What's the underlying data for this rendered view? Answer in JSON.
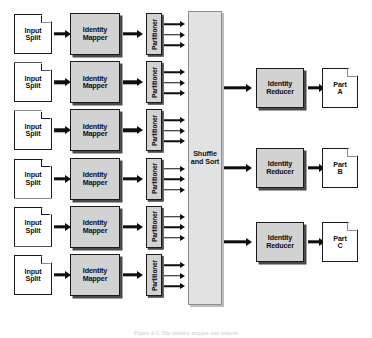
{
  "figure": {
    "caption": "Figure 4-3. The identity mapper and reducer",
    "background_color": "#fefefe",
    "box_fill_color": "#d2d2d2",
    "shuffle_fill_color": "#e2e2e2",
    "line_color": "#1a1a1a"
  },
  "labels": {
    "input_split": "Input\nSplit",
    "identity_mapper": "Identity\nMapper",
    "partitioner": "Partitioner",
    "shuffle_and_sort": "Shuffle\nand Sort",
    "identity_reducer": "Identity\nReducer"
  },
  "input_splits": [
    {
      "id": "input-split-1",
      "label_line1": "Input",
      "label_line2": "Split"
    },
    {
      "id": "input-split-2",
      "label_line1": "Input",
      "label_line2": "Split"
    },
    {
      "id": "input-split-3",
      "label_line1": "Input",
      "label_line2": "Split"
    },
    {
      "id": "input-split-4",
      "label_line1": "Input",
      "label_line2": "Split"
    },
    {
      "id": "input-split-5",
      "label_line1": "Input",
      "label_line2": "Split"
    },
    {
      "id": "input-split-6",
      "label_line1": "Input",
      "label_line2": "Split"
    }
  ],
  "mappers": [
    {
      "id": "identity-mapper-1",
      "label_line1": "Identity",
      "label_line2": "Mapper"
    },
    {
      "id": "identity-mapper-2",
      "label_line1": "Identity",
      "label_line2": "Mapper"
    },
    {
      "id": "identity-mapper-3",
      "label_line1": "Identity",
      "label_line2": "Mapper"
    },
    {
      "id": "identity-mapper-4",
      "label_line1": "Identity",
      "label_line2": "Mapper"
    },
    {
      "id": "identity-mapper-5",
      "label_line1": "Identity",
      "label_line2": "Mapper"
    },
    {
      "id": "identity-mapper-6",
      "label_line1": "Identity",
      "label_line2": "Mapper"
    }
  ],
  "partitioners": [
    {
      "id": "partitioner-1",
      "label": "Partitioner",
      "out_arrows": 3
    },
    {
      "id": "partitioner-2",
      "label": "Partitioner",
      "out_arrows": 3
    },
    {
      "id": "partitioner-3",
      "label": "Partitioner",
      "out_arrows": 3
    },
    {
      "id": "partitioner-4",
      "label": "Partitioner",
      "out_arrows": 3
    },
    {
      "id": "partitioner-5",
      "label": "Partitioner",
      "out_arrows": 3
    },
    {
      "id": "partitioner-6",
      "label": "Partitioner",
      "out_arrows": 3
    }
  ],
  "shuffle": {
    "label_line1": "Shuffle",
    "label_line2": "and Sort"
  },
  "reducers": [
    {
      "id": "identity-reducer-1",
      "label_line1": "Identity",
      "label_line2": "Reducer"
    },
    {
      "id": "identity-reducer-2",
      "label_line1": "Identity",
      "label_line2": "Reducer"
    },
    {
      "id": "identity-reducer-3",
      "label_line1": "Identity",
      "label_line2": "Reducer"
    }
  ],
  "outputs": [
    {
      "id": "output-part-a",
      "label_line1": "Part",
      "label_line2": "A"
    },
    {
      "id": "output-part-b",
      "label_line1": "Part",
      "label_line2": "B"
    },
    {
      "id": "output-part-c",
      "label_line1": "Part",
      "label_line2": "C"
    }
  ]
}
